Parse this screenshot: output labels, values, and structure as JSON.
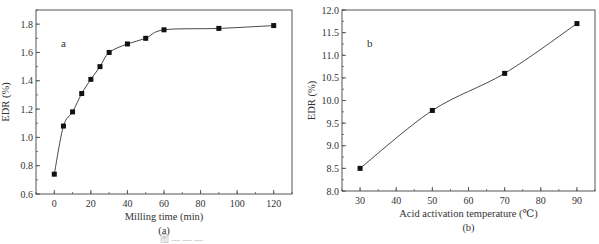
{
  "chart_data": [
    {
      "type": "line",
      "panel_letter": "a",
      "sub_label": "(a)",
      "title": "",
      "xlabel": "Milling time (min)",
      "ylabel": "EDR (%)",
      "xlim": [
        -10,
        130
      ],
      "ylim": [
        0.6,
        1.9
      ],
      "xticks": [
        0,
        20,
        40,
        60,
        80,
        100,
        120
      ],
      "yticks": [
        0.6,
        0.8,
        1.0,
        1.2,
        1.4,
        1.6,
        1.8
      ],
      "ytick_labels": [
        "0.6",
        "0.8",
        "1.0",
        "1.2",
        "1.4",
        "1.6",
        "1.8"
      ],
      "grid": false,
      "marker": "square",
      "series": [
        {
          "name": "EDR vs milling time",
          "x": [
            0,
            5,
            10,
            15,
            20,
            25,
            30,
            40,
            50,
            60,
            90,
            120
          ],
          "y": [
            0.74,
            1.08,
            1.18,
            1.31,
            1.41,
            1.5,
            1.6,
            1.66,
            1.7,
            1.76,
            1.77,
            1.79
          ]
        }
      ]
    },
    {
      "type": "line",
      "panel_letter": "b",
      "sub_label": "(b)",
      "title": "",
      "xlabel": "Acid activation temperature (℃)",
      "ylabel": "EDR (%)",
      "xlim": [
        25,
        95
      ],
      "ylim": [
        8.0,
        12.0
      ],
      "xticks": [
        30,
        40,
        50,
        60,
        70,
        80,
        90
      ],
      "yticks": [
        8.0,
        8.5,
        9.0,
        9.5,
        10.0,
        10.5,
        11.0,
        11.5,
        12.0
      ],
      "ytick_labels": [
        "8.0",
        "8.5",
        "9.0",
        "9.5",
        "10.0",
        "10.5",
        "11.0",
        "11.5",
        "12.0"
      ],
      "grid": false,
      "marker": "square",
      "series": [
        {
          "name": "EDR vs acid activation temperature",
          "x": [
            30,
            50,
            70,
            90
          ],
          "y": [
            8.5,
            9.78,
            10.6,
            11.7
          ]
        }
      ]
    }
  ],
  "caption": "图 — — —"
}
